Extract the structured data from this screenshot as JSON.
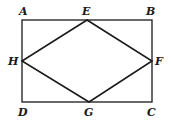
{
  "diagram": {
    "type": "geometry",
    "rectangle": {
      "vertices": [
        "A",
        "B",
        "C",
        "D"
      ],
      "coords": {
        "A": [
          22,
          20
        ],
        "B": [
          152,
          20
        ],
        "C": [
          152,
          102
        ],
        "D": [
          22,
          102
        ]
      }
    },
    "rhombus": {
      "vertices": [
        "E",
        "F",
        "G",
        "H"
      ],
      "coords": {
        "E": [
          87,
          20
        ],
        "F": [
          152,
          61
        ],
        "G": [
          89,
          102
        ],
        "H": [
          22,
          61
        ]
      }
    },
    "labels": {
      "A": "A",
      "B": "B",
      "C": "C",
      "D": "D",
      "E": "E",
      "F": "F",
      "G": "G",
      "H": "H"
    },
    "stroke_color": "#1a1a1a"
  }
}
